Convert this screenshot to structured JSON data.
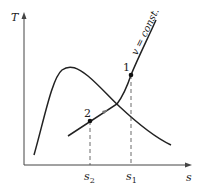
{
  "diagram": {
    "type": "T-s diagram",
    "axes": {
      "y_label": "T",
      "x_label": "s"
    },
    "curve_label": "v = const.",
    "points": [
      {
        "id": "1",
        "label": "1"
      },
      {
        "id": "2",
        "label": "2"
      }
    ],
    "x_ticks": [
      {
        "label": "s",
        "sub": "2"
      },
      {
        "label": "s",
        "sub": "1"
      }
    ],
    "colors": {
      "line": "#222222",
      "background": "#ffffff"
    }
  }
}
